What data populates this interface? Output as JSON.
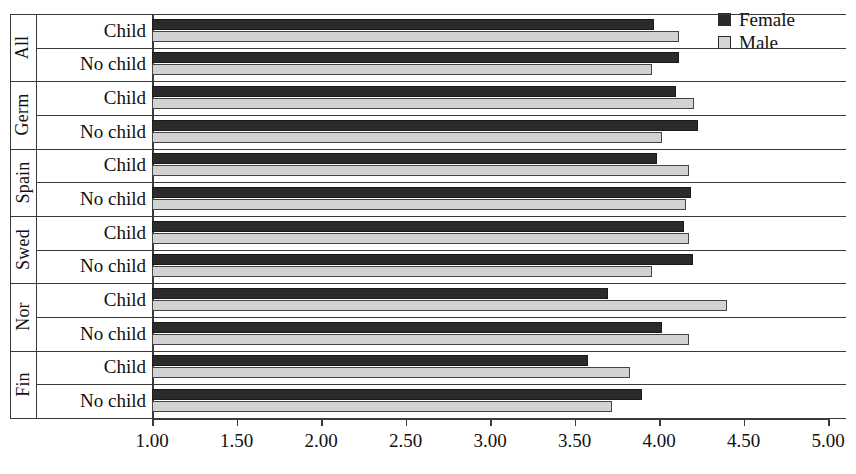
{
  "legend": {
    "position": "top-right",
    "items": [
      {
        "label": "Female",
        "color": "#2b2b2b",
        "swatch": "filled-square-icon"
      },
      {
        "label": "Male",
        "color": "#d5d5d5",
        "swatch": "open-square-icon"
      }
    ]
  },
  "axis": {
    "tick_labels": [
      "1.00",
      "1.50",
      "2.00",
      "2.50",
      "3.00",
      "3.50",
      "4.00",
      "4.50",
      "5.00"
    ],
    "tick_values": [
      1.0,
      1.5,
      2.0,
      2.5,
      3.0,
      3.5,
      4.0,
      4.5,
      5.0
    ],
    "xmin": 1.0,
    "xmax": 5.0
  },
  "groups": [
    {
      "name": "All",
      "rows": [
        "Child",
        "No child"
      ]
    },
    {
      "name": "Germ",
      "rows": [
        "Child",
        "No child"
      ]
    },
    {
      "name": "Spain",
      "rows": [
        "Child",
        "No child"
      ]
    },
    {
      "name": "Swed",
      "rows": [
        "Child",
        "No child"
      ]
    },
    {
      "name": "Nor",
      "rows": [
        "Child",
        "No child"
      ]
    },
    {
      "name": "Fin",
      "rows": [
        "Child",
        "No child"
      ]
    }
  ],
  "chart_data": {
    "type": "bar",
    "orientation": "horizontal",
    "title": "",
    "xlabel": "",
    "ylabel": "",
    "xlim": [
      1.0,
      5.0
    ],
    "grid": false,
    "legend_position": "top-right",
    "categories": [
      "All / Child",
      "All / No child",
      "Germ / Child",
      "Germ / No child",
      "Spain / Child",
      "Spain / No child",
      "Swed / Child",
      "Swed / No child",
      "Nor / Child",
      "Nor / No child",
      "Fin / Child",
      "Fin / No child"
    ],
    "series": [
      {
        "name": "Female",
        "color": "#2b2b2b",
        "values": [
          3.97,
          4.12,
          4.1,
          4.23,
          3.99,
          4.19,
          4.15,
          4.2,
          3.7,
          4.02,
          3.58,
          3.9
        ]
      },
      {
        "name": "Male",
        "color": "#d2d2d2",
        "values": [
          4.12,
          3.96,
          4.21,
          4.02,
          4.18,
          4.16,
          4.18,
          3.96,
          4.4,
          4.18,
          3.83,
          3.72
        ]
      }
    ]
  }
}
